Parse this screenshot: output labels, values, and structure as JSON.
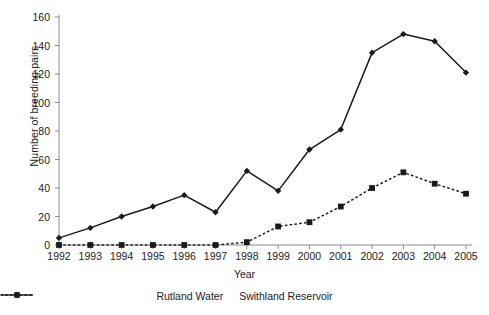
{
  "chart_data": {
    "type": "line",
    "title": "",
    "xlabel": "Year",
    "ylabel": "Number of breeding pairs",
    "categories": [
      1992,
      1993,
      1994,
      1995,
      1996,
      1997,
      1998,
      1999,
      2000,
      2001,
      2002,
      2003,
      2004,
      2005
    ],
    "xtick_labels": [
      "1992",
      "1993",
      "1994",
      "1995",
      "1996",
      "1997",
      "1998",
      "1999",
      "2000",
      "2001",
      "2002",
      "2003",
      "2004",
      "2005"
    ],
    "ytick_labels": [
      "0",
      "20",
      "40",
      "60",
      "80",
      "100",
      "120",
      "140",
      "160"
    ],
    "yticks": [
      0,
      20,
      40,
      60,
      80,
      100,
      120,
      140,
      160
    ],
    "ylim": [
      0,
      160
    ],
    "grid": false,
    "legend_position": "bottom",
    "series": [
      {
        "name": "Rutland Water",
        "marker": "diamond",
        "linestyle": "solid",
        "color": "#1a1a1a",
        "values": [
          5,
          12,
          20,
          27,
          35,
          23,
          52,
          38,
          67,
          81,
          135,
          148,
          143,
          121
        ]
      },
      {
        "name": "Swithland Reservoir",
        "marker": "square",
        "linestyle": "dotted",
        "color": "#1a1a1a",
        "values": [
          0,
          0,
          0,
          0,
          0,
          0,
          2,
          13,
          16,
          27,
          40,
          51,
          43,
          36
        ]
      }
    ]
  },
  "axis": {
    "x_title": "Year",
    "y_title": "Number of breeding pairs"
  },
  "legend": {
    "items": [
      {
        "label": "Rutland Water"
      },
      {
        "label": "Swithland Reservoir"
      }
    ]
  }
}
